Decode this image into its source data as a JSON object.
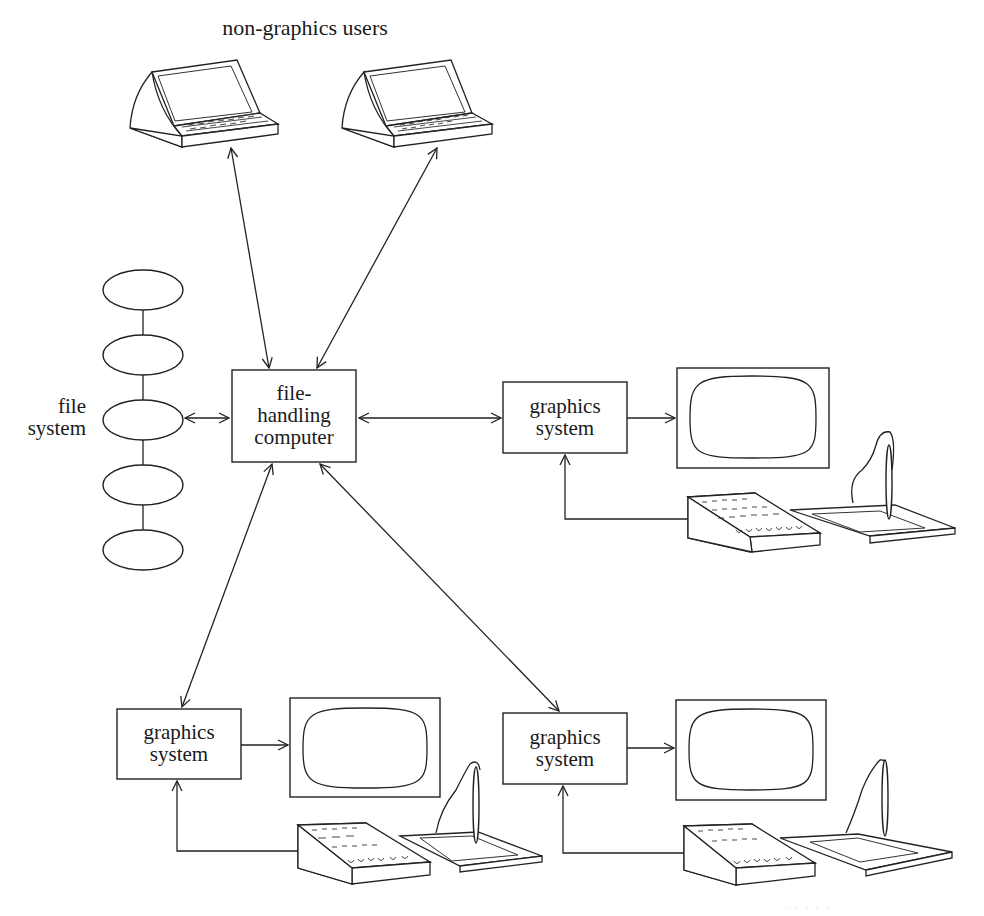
{
  "diagram": {
    "title": "non-graphics users",
    "file_system": {
      "label_line1": "file",
      "label_line2": "system",
      "disk_count": 5
    },
    "hub": {
      "label_line1": "file-",
      "label_line2": "handling",
      "label_line3": "computer"
    },
    "graphics_stations": [
      {
        "position": "right",
        "label_line1": "graphics",
        "label_line2": "system"
      },
      {
        "position": "bottom-left",
        "label_line1": "graphics",
        "label_line2": "system"
      },
      {
        "position": "bottom-right",
        "label_line1": "graphics",
        "label_line2": "system"
      }
    ],
    "terminals": [
      {
        "position": "top-left",
        "type": "non-graphics terminal"
      },
      {
        "position": "top-right",
        "type": "non-graphics terminal"
      }
    ],
    "connections": [
      {
        "from": "terminal-top-left",
        "to": "file-handling computer",
        "type": "bidirectional"
      },
      {
        "from": "terminal-top-right",
        "to": "file-handling computer",
        "type": "bidirectional"
      },
      {
        "from": "file system",
        "to": "file-handling computer",
        "type": "bidirectional"
      },
      {
        "from": "file-handling computer",
        "to": "graphics system (right)",
        "type": "bidirectional"
      },
      {
        "from": "file-handling computer",
        "to": "graphics system (bottom-left)",
        "type": "bidirectional"
      },
      {
        "from": "file-handling computer",
        "to": "graphics system (bottom-right)",
        "type": "bidirectional"
      },
      {
        "from": "graphics system",
        "to": "display monitor",
        "type": "directed"
      },
      {
        "from": "keyboard/tablet",
        "to": "graphics system",
        "type": "directed"
      }
    ],
    "caption": "· · · · ·"
  }
}
